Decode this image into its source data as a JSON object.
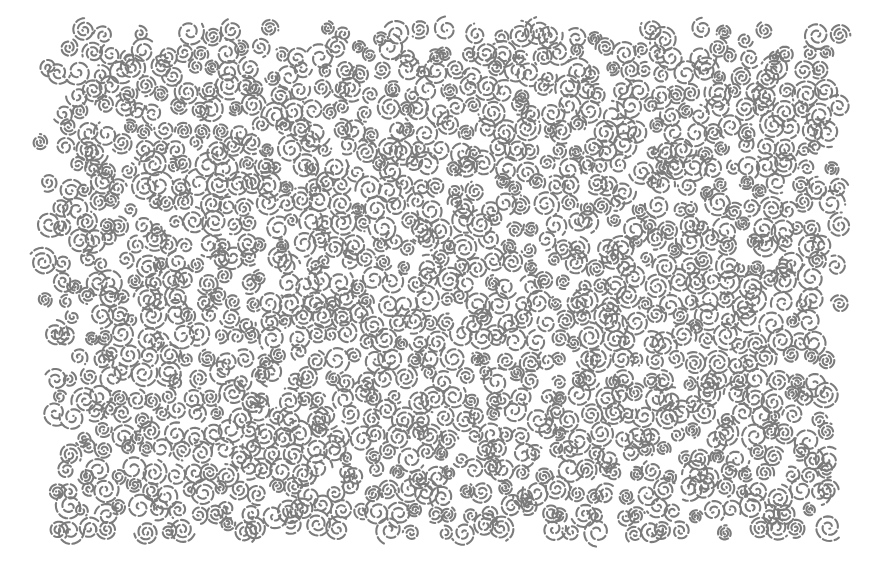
{
  "artwork": {
    "kind": "generative spiral swirl texture",
    "canvas": {
      "width": 888,
      "height": 562,
      "background": "#ffffff"
    },
    "stroke_color": "#7b7b7b",
    "stroke_width": 2.1,
    "region": {
      "top_left": [
        42,
        34
      ],
      "top_right": [
        838,
        34
      ],
      "bottom_right": [
        832,
        532
      ],
      "bottom_left": [
        56,
        528
      ],
      "edge_jitter": 6
    },
    "swirls": {
      "seed": 20240611,
      "grid_spacing": 19,
      "position_jitter": 6,
      "radius_min": 7,
      "radius_max": 15,
      "turns_min": 1.6,
      "turns_max": 2.6,
      "dash_on": 9,
      "dash_off": 3.2
    }
  }
}
